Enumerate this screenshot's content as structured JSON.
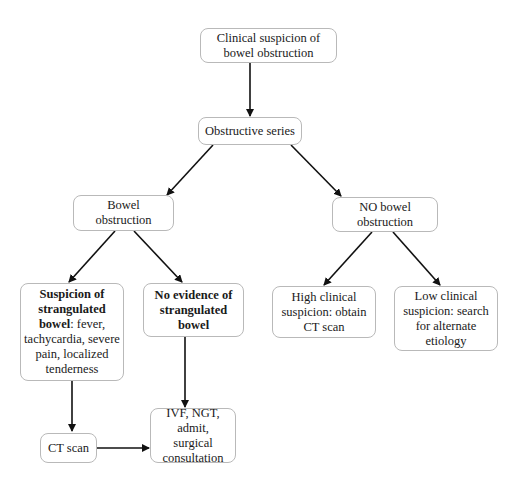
{
  "diagram": {
    "type": "flowchart",
    "nodes": {
      "start": {
        "text": "Clinical suspicion of bowel obstruction"
      },
      "series": {
        "text": "Obstructive series"
      },
      "bowel": {
        "text": "Bowel obstruction"
      },
      "no_bowel": {
        "text": "NO bowel obstruction"
      },
      "strangulated": {
        "bold": "Suspicion of strangulated bowel",
        "text": ": fever, tachycardia, severe pain, localized tenderness"
      },
      "no_strangulated": {
        "bold": "No evidence of strangulated bowel"
      },
      "high": {
        "text": "High clinical suspicion: obtain CT scan"
      },
      "low": {
        "text": "Low clinical suspicion: search for alternate etiology"
      },
      "ct": {
        "text": "CT scan"
      },
      "ivf": {
        "text": "IVF, NGT, admit, surgical consultation"
      }
    },
    "edges": [
      [
        "start",
        "series"
      ],
      [
        "series",
        "bowel"
      ],
      [
        "series",
        "no_bowel"
      ],
      [
        "bowel",
        "strangulated"
      ],
      [
        "bowel",
        "no_strangulated"
      ],
      [
        "no_bowel",
        "high"
      ],
      [
        "no_bowel",
        "low"
      ],
      [
        "strangulated",
        "ct"
      ],
      [
        "no_strangulated",
        "ivf"
      ],
      [
        "ct",
        "ivf"
      ]
    ],
    "colors": {
      "line": "#111111",
      "border": "#b9b9b9"
    }
  }
}
